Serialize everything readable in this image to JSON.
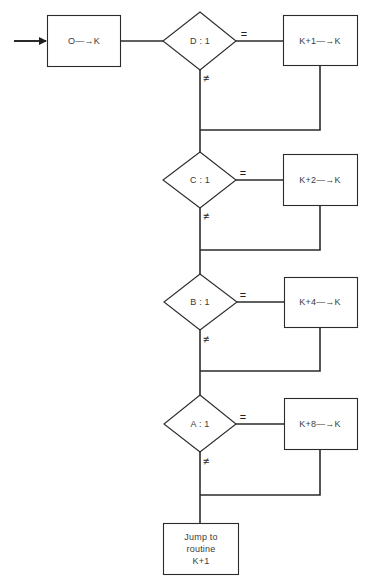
{
  "diagram": {
    "type": "flowchart",
    "start": {
      "label": "O—→K"
    },
    "decisions": [
      {
        "id": "D",
        "label": "D : 1",
        "true_label": "=",
        "false_label": "≠",
        "action": "K+1—→K"
      },
      {
        "id": "C",
        "label": "C : 1",
        "true_label": "=",
        "false_label": "≠",
        "action": "K+2—→K"
      },
      {
        "id": "B",
        "label": "B : 1",
        "true_label": "=",
        "false_label": "≠",
        "action": "K+4—→K"
      },
      {
        "id": "A",
        "label": "A : 1",
        "true_label": "=",
        "false_label": "≠",
        "action": "K+8—→K"
      }
    ],
    "end": {
      "lines": [
        "Jump to",
        "routine",
        "K+1"
      ]
    },
    "colors": {
      "stroke": "#2b2b2b",
      "background": "#ffffff"
    }
  }
}
